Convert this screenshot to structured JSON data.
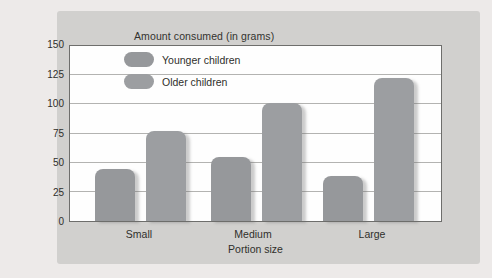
{
  "page": {
    "background": "#edeae9"
  },
  "card": {
    "background": "#d1d0ce"
  },
  "chart_data": {
    "type": "bar",
    "title": "Amount consumed (in grams)",
    "xlabel": "Portion size",
    "ylabel": "",
    "categories": [
      "Small",
      "Medium",
      "Large"
    ],
    "series": [
      {
        "name": "Younger children",
        "color": "#96989b",
        "values": [
          45,
          55,
          39
        ]
      },
      {
        "name": "Older children",
        "color": "#9c9ea1",
        "values": [
          77,
          101,
          123
        ]
      }
    ],
    "ylim": [
      0,
      150
    ],
    "yticks": [
      0,
      25,
      50,
      75,
      100,
      125,
      150
    ],
    "grid": "horizontal",
    "legend_position": "top-left-inside",
    "plot_background": "#fefefe",
    "gridline_color": "#b3b3b1",
    "frame_color": "#6e6e6c"
  }
}
